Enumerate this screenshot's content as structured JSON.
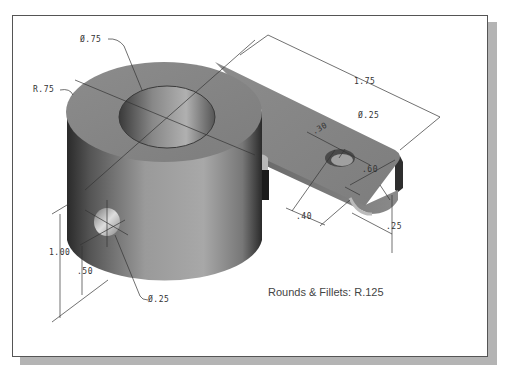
{
  "drawing": {
    "title": "Isometric part drawing with dimensions",
    "note": "Rounds & Fillets: R.125",
    "dimensions": {
      "top_hole_diameter": "Ø.75",
      "outer_radius": "R.75",
      "overall_arm_length": "1.75",
      "arm_hole_diameter": "Ø.25",
      "arm_hole_offset": ".30",
      "arm_width": ".60",
      "arm_hole_to_end": ".40",
      "arm_thickness": ".25",
      "cylinder_height": "1.00",
      "side_hole_height": ".50",
      "side_hole_diameter": "Ø.25"
    },
    "colors": {
      "part_face": "#8a8a8a",
      "part_dark": "#3a3a3a",
      "frame_shadow": "#b4b4b4",
      "line": "#333333"
    }
  }
}
